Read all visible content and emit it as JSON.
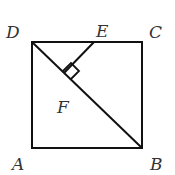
{
  "diagram": {
    "type": "geometry",
    "labels": {
      "A": "A",
      "B": "B",
      "C": "C",
      "D": "D",
      "E": "E",
      "F": "F"
    },
    "points": {
      "D": [
        32,
        42
      ],
      "C": [
        142,
        42
      ],
      "A": [
        32,
        148
      ],
      "B": [
        142,
        148
      ],
      "E": [
        94,
        42
      ],
      "F": [
        64,
        73
      ]
    },
    "stroke_color": "#111111",
    "label_color": "#333333"
  }
}
